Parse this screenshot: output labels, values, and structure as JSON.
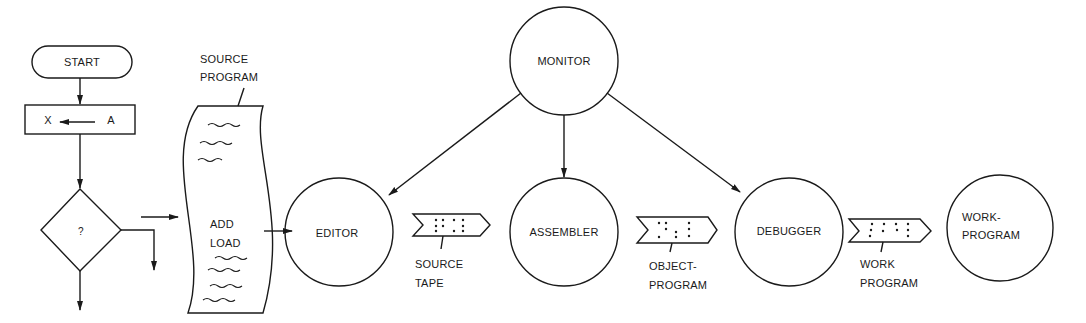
{
  "flowchart": {
    "start_label": "START",
    "assign_left": "X",
    "assign_right": "A",
    "decision_label": "?"
  },
  "source_program": {
    "caption_line1": "SOURCE",
    "caption_line2": "PROGRAM",
    "body_line1": "ADD",
    "body_line2": "LOAD"
  },
  "nodes": {
    "monitor": "MONITOR",
    "editor": "EDITOR",
    "assembler": "ASSEMBLER",
    "debugger": "DEBUGGER",
    "work_program_line1": "WORK-",
    "work_program_line2": "PROGRAM"
  },
  "tapes": {
    "source_tape": {
      "line1": "SOURCE",
      "line2": "TAPE"
    },
    "object_program": {
      "line1": "OBJECT-",
      "line2": "PROGRAM"
    },
    "work_program": {
      "line1": "WORK",
      "line2": "PROGRAM"
    }
  },
  "colors": {
    "ink": "#1a1a1a",
    "background": "#ffffff"
  }
}
